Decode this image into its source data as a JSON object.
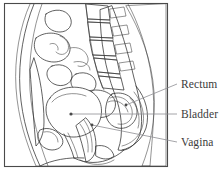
{
  "figure": {
    "frame": {
      "x": 4,
      "y": 3,
      "width": 164,
      "height": 164,
      "border_color": "#4a4a4a"
    },
    "background_color": "#ffffff",
    "line_color": "#2d2d2d",
    "stipple_color": "#6e6e6e"
  },
  "labels": [
    {
      "id": "rectum",
      "text": "Rectum",
      "text_x": 181,
      "text_y": 88,
      "leader": {
        "x1": 177,
        "y1": 84,
        "x2": 126,
        "y2": 105
      },
      "marker": {
        "x": 126,
        "y": 105
      }
    },
    {
      "id": "bladder",
      "text": "Bladder",
      "text_x": 181,
      "text_y": 118,
      "leader": {
        "x1": 177,
        "y1": 114,
        "x2": 71,
        "y2": 114
      },
      "marker": {
        "x": 71,
        "y": 114
      }
    },
    {
      "id": "vagina",
      "text": "Vagina",
      "text_x": 181,
      "text_y": 146,
      "leader": {
        "x1": 177,
        "y1": 142,
        "x2": 92,
        "y2": 125
      },
      "marker": {
        "x": 92,
        "y": 125
      }
    }
  ],
  "label_color": "#3b3b3b",
  "leader_color": "#8e8e93"
}
